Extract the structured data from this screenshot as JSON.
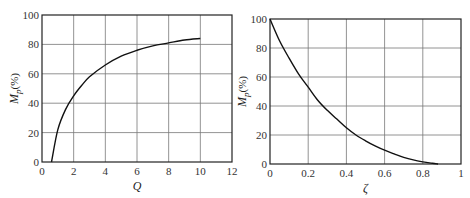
{
  "chart_data": [
    {
      "type": "line",
      "title": "",
      "xlabel": "Q",
      "ylabel": "Mp(%)",
      "xlim": [
        0,
        12
      ],
      "ylim": [
        0,
        100
      ],
      "xticks": [
        "0",
        "2",
        "4",
        "6",
        "8",
        "10",
        "12"
      ],
      "yticks": [
        "0",
        "20",
        "40",
        "60",
        "80",
        "100"
      ],
      "grid": true,
      "series": [
        {
          "name": "Mp vs Q",
          "x": [
            0.6,
            1.0,
            1.5,
            2.0,
            2.5,
            3.0,
            4.0,
            5.0,
            6.0,
            7.0,
            8.0,
            9.0,
            10.0
          ],
          "y": [
            0,
            22,
            36,
            45,
            52,
            58,
            66,
            72,
            76,
            79,
            81,
            83,
            84
          ]
        }
      ]
    },
    {
      "type": "line",
      "title": "",
      "xlabel": "ζ",
      "ylabel": "Mp(%)",
      "xlim": [
        0,
        1
      ],
      "ylim": [
        0,
        100
      ],
      "xticks": [
        "0",
        "0.2",
        "0.4",
        "0.6",
        "0.8",
        "1"
      ],
      "yticks": [
        "0",
        "20",
        "40",
        "60",
        "80",
        "100"
      ],
      "grid": true,
      "series": [
        {
          "name": "Mp vs zeta",
          "x": [
            0,
            0.05,
            0.1,
            0.15,
            0.2,
            0.25,
            0.3,
            0.35,
            0.4,
            0.45,
            0.5,
            0.55,
            0.6,
            0.65,
            0.7,
            0.75,
            0.8,
            0.85,
            0.88
          ],
          "y": [
            100,
            85,
            73,
            62,
            53,
            44,
            37,
            31,
            25,
            20,
            16,
            12.5,
            9.5,
            7,
            4.6,
            2.8,
            1.5,
            0.5,
            0
          ]
        }
      ]
    }
  ],
  "left": {
    "ylabel_main": "M",
    "ylabel_sub": "p",
    "ylabel_tail": "(%)",
    "xlabel": "Q"
  },
  "right": {
    "ylabel_main": "M",
    "ylabel_sub": "p",
    "ylabel_tail": "(%)",
    "xlabel": "ζ"
  }
}
